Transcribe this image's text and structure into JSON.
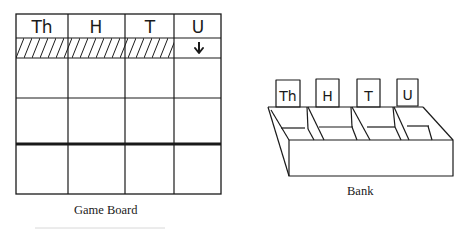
{
  "game_board": {
    "caption": "Game Board",
    "columns": [
      {
        "label": "Th",
        "meaning": "thousands"
      },
      {
        "label": "H",
        "meaning": "hundreds"
      },
      {
        "label": "T",
        "meaning": "tens"
      },
      {
        "label": "U",
        "meaning": "units"
      }
    ],
    "hatched_columns": [
      "Th",
      "H",
      "T"
    ],
    "arrow_column": "U",
    "arrow_glyph": "down-arrow",
    "rows": 5,
    "thick_separator_after_row": 4
  },
  "bank": {
    "caption": "Bank",
    "compartment_labels": [
      "Th",
      "H",
      "T",
      "U"
    ]
  }
}
